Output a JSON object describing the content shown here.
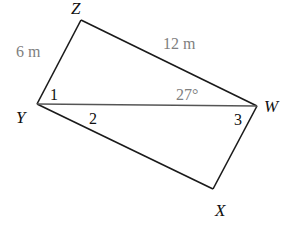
{
  "figure": {
    "colors": {
      "edge": "#1a1a1a",
      "diagonal": "#555555",
      "measure_text": "#808080",
      "label_text": "#111111"
    },
    "vertices": {
      "Z": {
        "label": "Z",
        "x": 81,
        "y": 20
      },
      "W": {
        "label": "W",
        "x": 257,
        "y": 106
      },
      "X": {
        "label": "X",
        "x": 213,
        "y": 189
      },
      "Y": {
        "label": "Y",
        "x": 37,
        "y": 104
      }
    },
    "sides": {
      "ZY": {
        "length_label": "6 m"
      },
      "ZW": {
        "length_label": "12 m"
      }
    },
    "diagonal": {
      "from": "Y",
      "to": "W"
    },
    "angles": {
      "angle_1": {
        "label": "1",
        "at": "Y"
      },
      "angle_2": {
        "label": "2",
        "at": "Y"
      },
      "angle_3": {
        "label": "3",
        "at": "W"
      },
      "given": {
        "label": "27°",
        "at": "W"
      }
    }
  }
}
